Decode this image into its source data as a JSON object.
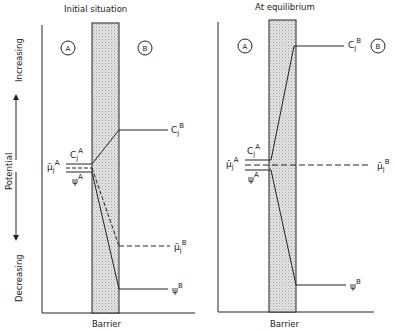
{
  "axis": {
    "label": "Potential",
    "increasing": "Increasing",
    "decreasing": "Decreasing"
  },
  "panels": [
    {
      "title": "Initial situation",
      "region_a": "A",
      "region_b": "B",
      "barrier_label": "Barrier",
      "labels": {
        "cA": "C",
        "cA_sub": "j",
        "cA_sup": "A",
        "muA": "μ̄",
        "muA_sub": "j",
        "muA_sup": "A",
        "psiA": "ψ",
        "psiA_sup": "A",
        "cB": "C",
        "cB_sub": "j",
        "cB_sup": "B",
        "muB": "μ̄",
        "muB_sub": "j",
        "muB_sup": "B",
        "psiB": "ψ",
        "psiB_sup": "B"
      }
    },
    {
      "title": "At equilibrium",
      "region_a": "A",
      "region_b": "B",
      "barrier_label": "Barrier",
      "labels": {
        "cA": "C",
        "cA_sub": "j",
        "cA_sup": "A",
        "muA": "μ̄",
        "muA_sub": "j",
        "muA_sup": "A",
        "psiA": "ψ",
        "psiA_sup": "A",
        "cB": "C",
        "cB_sub": "j",
        "cB_sup": "B",
        "muB": "μ̄",
        "muB_sub": "j",
        "muB_sup": "B",
        "psiB": "ψ",
        "psiB_sup": "B"
      }
    }
  ],
  "colors": {
    "line": "#222222",
    "barrier_fill": "#d8d8d8"
  }
}
